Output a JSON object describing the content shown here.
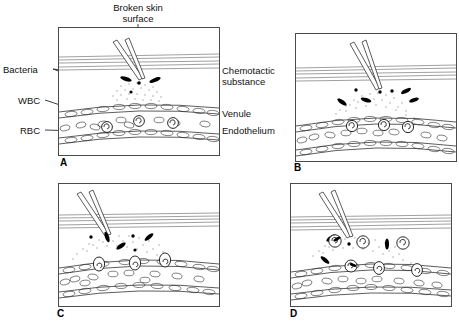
{
  "figure": {
    "background_color": "#ffffff",
    "ink_color": "#000000",
    "line_color": "#4a4a4a"
  },
  "labels": {
    "broken_skin_surface": "Broken skin\nsurface",
    "bacteria": "Bacteria",
    "wbc": "WBC",
    "rbc": "RBC",
    "chemotactic_substance": "Chemotactic\nsubstance",
    "venule": "Venule",
    "endothelium": "Endothelium"
  },
  "panels": [
    {
      "letter": "A",
      "name": "panel-a",
      "caption": "Bacteria enter through broken skin; chemotactic substances diffuse toward the venule",
      "x": 58,
      "y": 27,
      "w": 160,
      "h": 127
    },
    {
      "letter": "B",
      "name": "panel-b",
      "caption": "Margination: white blood cells adhere to the endothelium of the venule",
      "x": 295,
      "y": 33,
      "w": 160,
      "h": 127
    },
    {
      "letter": "C",
      "name": "panel-c",
      "caption": "Diapedesis: white blood cells squeeze between endothelial cells into the tissue",
      "x": 58,
      "y": 183,
      "w": 160,
      "h": 122
    },
    {
      "letter": "D",
      "name": "panel-d",
      "caption": "Phagocytosis: white blood cells migrate to and engulf the bacteria",
      "x": 290,
      "y": 183,
      "w": 160,
      "h": 122
    }
  ],
  "elements": {
    "skin_surface_lines": 5,
    "bacteria_rods_per_panel": [
      4,
      7,
      6,
      4
    ],
    "wbc_in_vessel_a": 4,
    "wbc_marginated_b": 3,
    "wbc_diapedesis_c": 3,
    "wbc_in_tissue_d": 4
  }
}
